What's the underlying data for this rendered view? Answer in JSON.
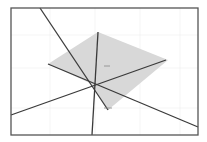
{
  "diagram": {
    "width": 207,
    "height": 142,
    "colors": {
      "background": "#ffffff",
      "frame": "#555555",
      "line": "#3a3a3a",
      "fill": "#d8d8d8",
      "grid": "#eeeeee",
      "tick": "#888888"
    },
    "frame": {
      "x": 11,
      "y": 8,
      "w": 187,
      "h": 127
    },
    "polygon": "98,32 168,60 108,110 92,84 48,64",
    "lines": [
      {
        "id": "line-a",
        "x1": 40,
        "y1": 8,
        "x2": 108,
        "y2": 110
      },
      {
        "id": "line-b",
        "x1": 98,
        "y1": 32,
        "x2": 92,
        "y2": 135
      },
      {
        "id": "line-c",
        "x1": 48,
        "y1": 64,
        "x2": 198,
        "y2": 127
      },
      {
        "id": "line-d",
        "x1": 11,
        "y1": 115,
        "x2": 166,
        "y2": 60
      }
    ],
    "marks": [
      {
        "id": "center-dash",
        "x1": 104,
        "y1": 66,
        "x2": 110,
        "y2": 66
      },
      {
        "id": "bottom-dash",
        "x1": 104,
        "y1": 108,
        "x2": 112,
        "y2": 108
      }
    ],
    "intersection": {
      "x": 92,
      "y": 84
    }
  }
}
